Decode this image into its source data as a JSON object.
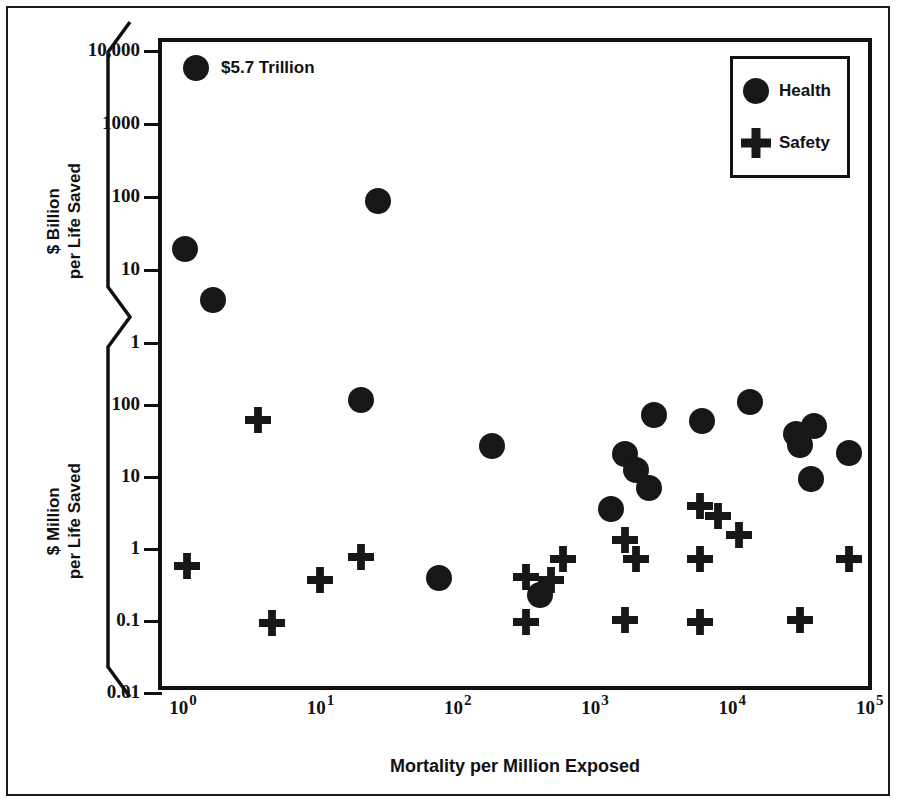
{
  "chart_data": {
    "type": "scatter",
    "title": "",
    "xlabel": "Mortality per Million Exposed",
    "ylabel_upper": "$ Billion\nper Life Saved",
    "ylabel_lower": "$ Million\nper Life Saved",
    "grid": false,
    "legend_position": "top-right",
    "x_axis": {
      "scale": "log10",
      "tick_bases": [
        "10",
        "10",
        "10",
        "10",
        "10",
        "10"
      ],
      "tick_exponents": [
        "0",
        "1",
        "2",
        "3",
        "4",
        "5"
      ],
      "tick_values": [
        0,
        1,
        2,
        3,
        4,
        5
      ],
      "range_exponents": [
        -0.15,
        5.05
      ]
    },
    "y_axis_upper": {
      "scale": "log10",
      "unit": "$ Billion per Life Saved",
      "tick_labels": [
        "10,000",
        "1000",
        "100",
        "10",
        "1"
      ],
      "tick_values": [
        10000,
        1000,
        100,
        10,
        1
      ]
    },
    "y_axis_lower": {
      "scale": "log10",
      "unit": "$ Million per Life Saved",
      "tick_labels": [
        "100",
        "10",
        "1",
        "0.1",
        "0.01"
      ],
      "tick_values": [
        100,
        10,
        1,
        0.1,
        0.01
      ]
    },
    "axis_break": true,
    "annotations": [
      {
        "text": "$5.7 Trillion",
        "x_exponent": 0.28,
        "panel": "upper",
        "value": 5700
      }
    ],
    "series": [
      {
        "name": "Health",
        "marker": "circle",
        "points": [
          {
            "x_exponent": 0.1,
            "panel": "upper",
            "value": 5700
          },
          {
            "x_exponent": 0.02,
            "panel": "upper",
            "value": 19
          },
          {
            "x_exponent": 0.22,
            "panel": "upper",
            "value": 3.8
          },
          {
            "x_exponent": 1.42,
            "panel": "upper",
            "value": 85
          },
          {
            "x_exponent": 1.3,
            "panel": "lower",
            "value": 115
          },
          {
            "x_exponent": 2.25,
            "panel": "lower",
            "value": 26
          },
          {
            "x_exponent": 1.87,
            "panel": "lower",
            "value": 0.38
          },
          {
            "x_exponent": 2.6,
            "panel": "lower",
            "value": 0.22
          },
          {
            "x_exponent": 3.12,
            "panel": "lower",
            "value": 3.5
          },
          {
            "x_exponent": 3.22,
            "panel": "lower",
            "value": 20
          },
          {
            "x_exponent": 3.3,
            "panel": "lower",
            "value": 12
          },
          {
            "x_exponent": 3.4,
            "panel": "lower",
            "value": 6.8
          },
          {
            "x_exponent": 3.43,
            "panel": "lower",
            "value": 70
          },
          {
            "x_exponent": 3.78,
            "panel": "lower",
            "value": 58
          },
          {
            "x_exponent": 4.13,
            "panel": "lower",
            "value": 105
          },
          {
            "x_exponent": 4.47,
            "panel": "lower",
            "value": 38
          },
          {
            "x_exponent": 4.5,
            "panel": "lower",
            "value": 27
          },
          {
            "x_exponent": 4.6,
            "panel": "lower",
            "value": 50
          },
          {
            "x_exponent": 4.58,
            "panel": "lower",
            "value": 9
          },
          {
            "x_exponent": 4.85,
            "panel": "lower",
            "value": 21
          }
        ]
      },
      {
        "name": "Safety",
        "marker": "cross",
        "points": [
          {
            "x_exponent": 0.55,
            "panel": "lower",
            "value": 60
          },
          {
            "x_exponent": 0.03,
            "panel": "lower",
            "value": 0.57
          },
          {
            "x_exponent": 0.65,
            "panel": "lower",
            "value": 0.09
          },
          {
            "x_exponent": 1.0,
            "panel": "lower",
            "value": 0.36
          },
          {
            "x_exponent": 1.3,
            "panel": "lower",
            "value": 0.75
          },
          {
            "x_exponent": 2.5,
            "panel": "lower",
            "value": 0.4
          },
          {
            "x_exponent": 2.5,
            "panel": "lower",
            "value": 0.095
          },
          {
            "x_exponent": 2.68,
            "panel": "lower",
            "value": 0.36
          },
          {
            "x_exponent": 2.77,
            "panel": "lower",
            "value": 0.7
          },
          {
            "x_exponent": 3.22,
            "panel": "lower",
            "value": 1.3
          },
          {
            "x_exponent": 3.3,
            "panel": "lower",
            "value": 0.7
          },
          {
            "x_exponent": 3.22,
            "panel": "lower",
            "value": 0.1
          },
          {
            "x_exponent": 3.77,
            "panel": "lower",
            "value": 3.8
          },
          {
            "x_exponent": 3.9,
            "panel": "lower",
            "value": 2.8
          },
          {
            "x_exponent": 4.05,
            "panel": "lower",
            "value": 1.5
          },
          {
            "x_exponent": 3.77,
            "panel": "lower",
            "value": 0.7
          },
          {
            "x_exponent": 3.77,
            "panel": "lower",
            "value": 0.095
          },
          {
            "x_exponent": 4.5,
            "panel": "lower",
            "value": 0.1
          },
          {
            "x_exponent": 4.85,
            "panel": "lower",
            "value": 0.7
          }
        ]
      }
    ]
  },
  "legend": {
    "entries": [
      {
        "label": "Health",
        "marker": "circle"
      },
      {
        "label": "Safety",
        "marker": "cross"
      }
    ]
  },
  "axis_titles": {
    "upper_line1": "$ Billion",
    "upper_line2": "per Life Saved",
    "lower_line1": "$ Million",
    "lower_line2": "per Life Saved",
    "x": "Mortality per Million Exposed"
  },
  "annotation": {
    "trillion": "$5.7 Trillion"
  }
}
